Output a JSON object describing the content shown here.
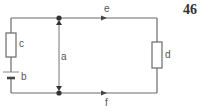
{
  "page_number": "46",
  "diagram": {
    "type": "circuit",
    "labels": {
      "resistor_left": "c",
      "battery": "b",
      "voltage_arrow": "a",
      "resistor_right": "d",
      "current_top": "e",
      "current_bottom": "f"
    },
    "colors": {
      "wire": "#6a6a6a",
      "junction": "#333333",
      "label": "#555555"
    }
  }
}
